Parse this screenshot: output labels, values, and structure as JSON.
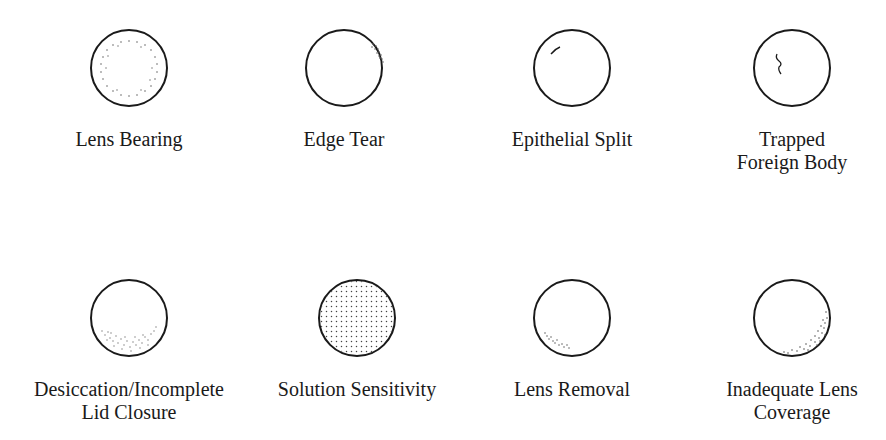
{
  "figure": {
    "line_color": "#1a1a1a",
    "dot_color": "#555555",
    "circle_radius": 38,
    "panels": [
      {
        "id": "lens-bearing",
        "label_lines": [
          "Lens Bearing"
        ],
        "pattern": "ring-of-dots",
        "cx": 129,
        "cy": 68
      },
      {
        "id": "edge-tear",
        "label_lines": [
          "Edge Tear"
        ],
        "pattern": "upper-right-dot-cluster",
        "cx": 344,
        "cy": 68
      },
      {
        "id": "epithelial-split",
        "label_lines": [
          "Epithelial Split"
        ],
        "pattern": "short-arc-line-upper-left",
        "cx": 572,
        "cy": 68
      },
      {
        "id": "trapped-foreign-body",
        "label_lines": [
          "Trapped",
          "Foreign Body"
        ],
        "pattern": "squiggle-track-upper-left",
        "cx": 792,
        "cy": 68
      },
      {
        "id": "desiccation-incomplete-lid-closure",
        "label_lines": [
          "Desiccation/Incomplete",
          "Lid Closure"
        ],
        "pattern": "lower-band-of-dots",
        "cx": 129,
        "cy": 318
      },
      {
        "id": "solution-sensitivity",
        "label_lines": [
          "Solution Sensitivity"
        ],
        "pattern": "uniform-dense-dots",
        "cx": 357,
        "cy": 318
      },
      {
        "id": "lens-removal",
        "label_lines": [
          "Lens Removal"
        ],
        "pattern": "lower-left-dot-arc",
        "cx": 572,
        "cy": 318
      },
      {
        "id": "inadequate-lens-coverage",
        "label_lines": [
          "Inadequate Lens",
          "Coverage"
        ],
        "pattern": "lower-right-crescent-dots",
        "cx": 792,
        "cy": 318
      }
    ]
  }
}
